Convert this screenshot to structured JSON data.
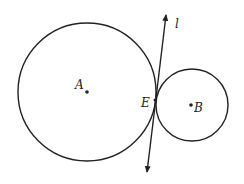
{
  "diagram": {
    "circles": [
      {
        "name": "circle-A",
        "cx": 87,
        "cy": 92,
        "r": 69
      },
      {
        "name": "circle-B",
        "cx": 192,
        "cy": 105,
        "r": 36
      }
    ],
    "points": {
      "A": {
        "label": "A",
        "x": 87,
        "y": 92
      },
      "B": {
        "label": "B",
        "x": 191,
        "y": 105
      },
      "E": {
        "label": "E",
        "x": 155,
        "y": 100
      }
    },
    "line": {
      "label": "l",
      "x1": 147,
      "y1": 172,
      "x2": 166,
      "y2": 15
    },
    "stroke_color": "#222222"
  }
}
